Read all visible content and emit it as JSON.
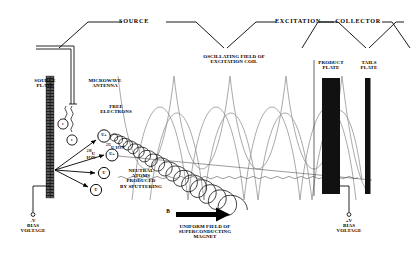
{
  "diagram": {
    "sections": [
      {
        "id": "source",
        "label": "SOURCE"
      },
      {
        "id": "excitation",
        "label": "EXCITATION"
      },
      {
        "id": "collector",
        "label": "COLLECTOR"
      }
    ],
    "labels": {
      "source_plate": "SOURCE\nPLATE",
      "microwave_antenna": "MICROWAVE\nANTENNA",
      "free_electrons": "FREE\nELECTRONS",
      "oscillating_field": "OSCILLATING FIELD OF\nEXCITATION COIL",
      "neutral_atoms": "NEUTRAL\nATOMS\nPRODUCED\nBY SPUTTERING",
      "uniform_field": "UNIFORM FIELD OF\nSUPERCONDUCTING\nMAGNET",
      "product_plate": "PRODUCT\nPLATE",
      "tails_plate": "TAILS\nPLATE",
      "bias_left": "-V\nBIAS\nVOLTAGE",
      "bias_right": "+V\nBIAS\nVOLTAGE",
      "magnetic_field_symbol": "B"
    },
    "species": {
      "ion_235": {
        "mass": "235",
        "element": "U",
        "word": "ION",
        "marker": "U+"
      },
      "ion_238": {
        "mass": "238",
        "element": "U",
        "word": "ION",
        "marker": "U+"
      },
      "neutral": {
        "marker": "U"
      },
      "electron": {
        "marker": "e"
      }
    },
    "colors": {
      "ink": "#000000",
      "wave": "#9a9a9a",
      "plate_fill": "#111111",
      "background": "#ffffff"
    }
  }
}
